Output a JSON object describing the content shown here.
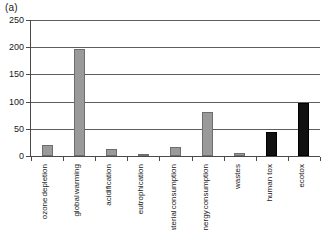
{
  "panel": {
    "label": "(a)"
  },
  "chart_data": {
    "type": "bar",
    "title": "",
    "xlabel": "",
    "ylabel": "",
    "ylim": [
      0,
      250
    ],
    "yticks": [
      0,
      50,
      100,
      150,
      200,
      250
    ],
    "ytick_labels": [
      "0",
      "50",
      "100",
      "150",
      "200",
      "250"
    ],
    "grid": true,
    "legend": "none",
    "categories": [
      "ozone depletion",
      "global warming",
      "acidification",
      "eutrophication",
      "raw material consumption",
      "energy consumption",
      "wastes",
      "human tox",
      "ecotox"
    ],
    "category_lines": [
      [
        "ozone",
        "depletion"
      ],
      [
        "global",
        "warming"
      ],
      [
        "acidification"
      ],
      [
        "eutrophication"
      ],
      [
        "raw material",
        "consumption"
      ],
      [
        "energy",
        "consumption"
      ],
      [
        "wastes"
      ],
      [
        "human tox"
      ],
      [
        "ecotox"
      ]
    ],
    "values": [
      21,
      196,
      13,
      3,
      17,
      80,
      6,
      45,
      97
    ],
    "bar_colors": [
      "#9a9a9a",
      "#9a9a9a",
      "#9a9a9a",
      "#9a9a9a",
      "#9a9a9a",
      "#9a9a9a",
      "#9a9a9a",
      "#111111",
      "#111111"
    ]
  },
  "colors": {
    "gray_bar": "#9a9a9a",
    "black_bar": "#111111",
    "axis": "#4a4a4a",
    "gridline": "#5d5d5d",
    "background": "#ffffff",
    "text": "#1a1a1a"
  }
}
